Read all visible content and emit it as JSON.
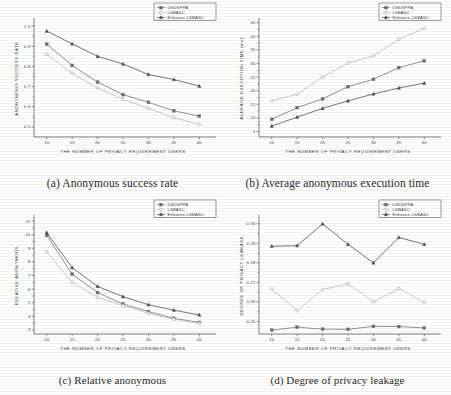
{
  "figure": {
    "xlabel": "THE NUMBER OF PRIVACY REQUIREMENT USERS",
    "x_ticks": [
      "10",
      "15",
      "20",
      "25",
      "30",
      "35",
      "40"
    ],
    "legend": [
      {
        "label": "DSDSPPA",
        "marker": "square",
        "color": "#6e6e6e"
      },
      {
        "label": "LSBASC",
        "marker": "circle",
        "color": "#b9b9b9"
      },
      {
        "label": "Enhance-LSBASC",
        "marker": "triangle",
        "color": "#4a4a4a"
      }
    ]
  },
  "panels": [
    {
      "key": "a",
      "caption": "(a)   Anonymous success rate"
    },
    {
      "key": "b",
      "caption": "(b) Average anonymous execution time"
    },
    {
      "key": "c",
      "caption": "(c) Relative anonymous"
    },
    {
      "key": "d",
      "caption": "(d) Degree of privacy leakage"
    }
  ],
  "chart_data": [
    {
      "panel": "a",
      "type": "line",
      "title": "Anonymous success rate",
      "xlabel": "THE NUMBER OF PRIVACY REQUIREMENT USERS",
      "ylabel": "ANONYMOUS SUCCESS RATE",
      "x": [
        10,
        15,
        20,
        25,
        30,
        35,
        40
      ],
      "xlim": [
        7.5,
        42.5
      ],
      "ylim": [
        0.45,
        1.03
      ],
      "yticks": [
        0.5,
        0.6,
        0.7,
        0.8,
        0.9,
        1.0
      ],
      "ytick_labels": [
        "0.5",
        "0.6",
        "0.7",
        "0.8",
        "0.9",
        "1.0"
      ],
      "grid": false,
      "legend_position": "top-right",
      "series": [
        {
          "name": "DSDSPPA",
          "marker": "square",
          "color": "#6e6e6e",
          "values": [
            0.91,
            0.805,
            0.722,
            0.66,
            0.622,
            0.58,
            0.553
          ]
        },
        {
          "name": "LSBASC",
          "marker": "circle",
          "color": "#b9b9b9",
          "values": [
            0.86,
            0.766,
            0.693,
            0.637,
            0.592,
            0.546,
            0.512
          ]
        },
        {
          "name": "Enhance-LSBASC",
          "marker": "triangle",
          "color": "#4a4a4a",
          "values": [
            0.975,
            0.912,
            0.85,
            0.812,
            0.76,
            0.735,
            0.702
          ]
        }
      ]
    },
    {
      "panel": "b",
      "type": "line",
      "title": "Average anonymous execution time",
      "xlabel": "THE NUMBER OF PRIVACY REQUIREMENT USERS",
      "ylabel": "AVERAGE EXECUTION TIME (ms)",
      "x": [
        10,
        15,
        20,
        25,
        30,
        35,
        40
      ],
      "xlim": [
        7.5,
        42.5
      ],
      "ylim": [
        3.0,
        46.0
      ],
      "yticks": [
        5,
        10,
        15,
        20,
        25,
        30,
        35,
        40,
        45
      ],
      "ytick_labels": [
        "5",
        "10",
        "15",
        "20",
        "25",
        "30",
        "35",
        "40",
        "45"
      ],
      "grid": false,
      "legend_position": "top-right",
      "series": [
        {
          "name": "DSDSPPA",
          "marker": "square",
          "color": "#6e6e6e",
          "values": [
            9.5,
            13.8,
            17.0,
            21.5,
            24.2,
            28.5,
            31.0
          ]
        },
        {
          "name": "LSBASC",
          "marker": "circle",
          "color": "#b9b9b9",
          "values": [
            16.3,
            18.7,
            25.0,
            30.2,
            32.8,
            39.0,
            43.0
          ]
        },
        {
          "name": "Enhance-LSBASC",
          "marker": "triangle",
          "color": "#4a4a4a",
          "values": [
            7.0,
            10.3,
            13.5,
            16.3,
            18.8,
            21.0,
            22.8
          ]
        }
      ]
    },
    {
      "panel": "c",
      "type": "line",
      "title": "Relative anonymous",
      "xlabel": "THE NUMBER OF PRIVACY REQUIREMENT USERS",
      "ylabel": "RELATIVE ANONYMOUS",
      "x": [
        10,
        15,
        20,
        25,
        30,
        35,
        40
      ],
      "xlim": [
        7.5,
        42.5
      ],
      "ylim": [
        2.7,
        11.3
      ],
      "yticks": [
        3,
        4,
        5,
        6,
        7,
        8,
        9,
        10,
        11
      ],
      "ytick_labels": [
        "3",
        "4",
        "5",
        "6",
        "7",
        "8",
        "9",
        "10",
        "11"
      ],
      "grid": false,
      "legend_position": "top-right",
      "series": [
        {
          "name": "DSDSPPA",
          "marker": "square",
          "color": "#6e6e6e",
          "values": [
            9.95,
            7.1,
            5.75,
            4.9,
            4.35,
            3.85,
            3.55
          ]
        },
        {
          "name": "LSBASC",
          "marker": "circle",
          "color": "#b9b9b9",
          "values": [
            8.75,
            6.5,
            5.4,
            4.78,
            4.22,
            3.78,
            3.48
          ]
        },
        {
          "name": "Enhance-LSBASC",
          "marker": "triangle",
          "color": "#4a4a4a",
          "values": [
            10.15,
            7.58,
            6.2,
            5.45,
            4.85,
            4.45,
            4.1
          ]
        }
      ]
    },
    {
      "panel": "d",
      "type": "line",
      "title": "Degree of privacy leakage",
      "xlabel": "THE NUMBER OF PRIVACY REQUIREMENT USERS",
      "ylabel": "DEGREE OF PRIVACY LEAKAGE",
      "x": [
        10,
        15,
        20,
        25,
        30,
        35,
        40
      ],
      "xlim": [
        7.5,
        42.5
      ],
      "ylim": [
        0.2435,
        0.3035
      ],
      "yticks": [
        0.25,
        0.26,
        0.27,
        0.28,
        0.29,
        0.3
      ],
      "ytick_labels": [
        "0.25",
        "0.26",
        "0.27",
        "0.28",
        "0.29",
        "0.30"
      ],
      "grid": false,
      "legend_position": "top-right",
      "series": [
        {
          "name": "DSDSPPA",
          "marker": "square",
          "color": "#6e6e6e",
          "values": [
            0.2455,
            0.247,
            0.246,
            0.2459,
            0.2474,
            0.2473,
            0.2466
          ]
        },
        {
          "name": "LSBASC",
          "marker": "circle",
          "color": "#b9b9b9",
          "values": [
            0.2665,
            0.2555,
            0.2663,
            0.2692,
            0.26,
            0.2668,
            0.2598
          ]
        },
        {
          "name": "Enhance-LSBASC",
          "marker": "triangle",
          "color": "#4a4a4a",
          "values": [
            0.2885,
            0.2888,
            0.3,
            0.2895,
            0.28,
            0.293,
            0.2895
          ]
        }
      ]
    }
  ]
}
